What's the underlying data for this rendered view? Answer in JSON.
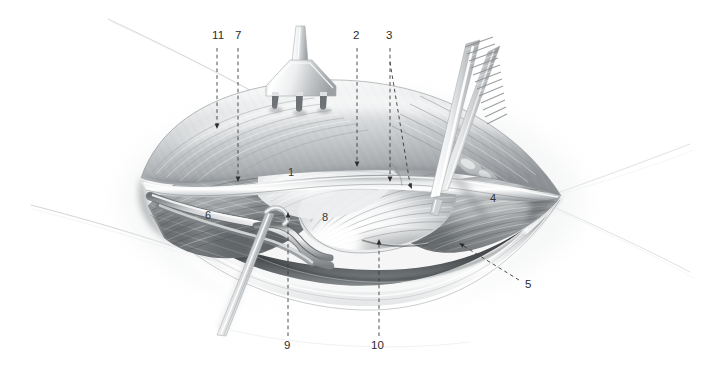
{
  "figure": {
    "width": 701,
    "height": 372,
    "background": "#ffffff",
    "style": "grayscale medical illustration, airbrush rendering",
    "ink_color": "#2b2b2b",
    "leader_color": "#3a3a3a"
  },
  "labels": [
    {
      "id": "11",
      "text": "11",
      "x": 212,
      "y": 30,
      "anchor": "top",
      "leader": {
        "type": "dashed-vertical",
        "x": 217,
        "y1": 48,
        "y2": 128,
        "arrow": "down"
      }
    },
    {
      "id": "7",
      "text": "7",
      "x": 236,
      "y": 30,
      "anchor": "top",
      "leader": {
        "type": "dashed-vertical",
        "x": 238,
        "y1": 48,
        "y2": 181,
        "arrow": "down"
      }
    },
    {
      "id": "2",
      "text": "2",
      "x": 354,
      "y": 30,
      "anchor": "top",
      "leader": {
        "type": "dashed-vertical",
        "x": 357,
        "y1": 48,
        "y2": 166,
        "arrow": "down"
      }
    },
    {
      "id": "3",
      "text": "3",
      "x": 387,
      "y": 30,
      "anchor": "top",
      "leader": {
        "type": "dashed-vertical",
        "x": 390,
        "y1": 48,
        "y2": 181,
        "arrow": "down"
      }
    },
    {
      "id": "3b",
      "text": "",
      "x": 0,
      "y": 0,
      "anchor": "none",
      "leader": {
        "type": "dashed-diagonal",
        "x1": 390,
        "y1": 62,
        "x2": 412,
        "y2": 188,
        "arrow": "down"
      }
    },
    {
      "id": "9",
      "text": "9",
      "x": 284,
      "y": 341,
      "anchor": "bottom",
      "leader": {
        "type": "dashed-vertical",
        "x": 288,
        "y1": 336,
        "y2": 213,
        "arrow": "up"
      }
    },
    {
      "id": "10",
      "text": "10",
      "x": 373,
      "y": 341,
      "anchor": "bottom",
      "leader": {
        "type": "dashed-vertical",
        "x": 379,
        "y1": 336,
        "y2": 240,
        "arrow": "up"
      }
    },
    {
      "id": "5",
      "text": "5",
      "x": 526,
      "y": 280,
      "anchor": "right",
      "leader": {
        "type": "dashed-diagonal",
        "x1": 519,
        "y1": 280,
        "x2": 459,
        "y2": 243,
        "arrow": "up-left"
      }
    },
    {
      "id": "1",
      "text": "1",
      "x": 289,
      "y": 167,
      "anchor": "inline",
      "leader": null
    },
    {
      "id": "4",
      "text": "4",
      "x": 490,
      "y": 193,
      "anchor": "inline",
      "leader": null
    },
    {
      "id": "6",
      "text": "6",
      "x": 205,
      "y": 210,
      "anchor": "inline",
      "leader": null
    },
    {
      "id": "8",
      "text": "8",
      "x": 322,
      "y": 212,
      "anchor": "inline",
      "leader": null
    }
  ],
  "instruments": [
    {
      "name": "rake-retractor",
      "description": "three-pronged skin rake retractor, top center",
      "x": 262,
      "y": 36
    },
    {
      "name": "forceps",
      "description": "serrated-handle tissue forceps, upper right, angled down-left",
      "x": 470,
      "y": 40
    },
    {
      "name": "probe",
      "description": "slender nerve hook / probe, lower left, angled down-left",
      "x": 250,
      "y": 270
    }
  ],
  "anatomy": [
    {
      "name": "wound-cavity",
      "description": "lens-shaped open surgical wound"
    },
    {
      "name": "superior-skin-flap",
      "description": "retracted upper skin and fascia flap"
    },
    {
      "name": "inferior-skin-flap",
      "description": "lower skin edge"
    },
    {
      "name": "muscle-belly-left",
      "description": "striated muscle, left of field (6)"
    },
    {
      "name": "muscle-belly-right",
      "description": "striated muscle, right of field (4)"
    },
    {
      "name": "fan-muscle",
      "description": "fan-shaped muscle insertion (8)"
    },
    {
      "name": "neurovascular-bundle",
      "description": "cord-like bundle crossing the field"
    }
  ]
}
